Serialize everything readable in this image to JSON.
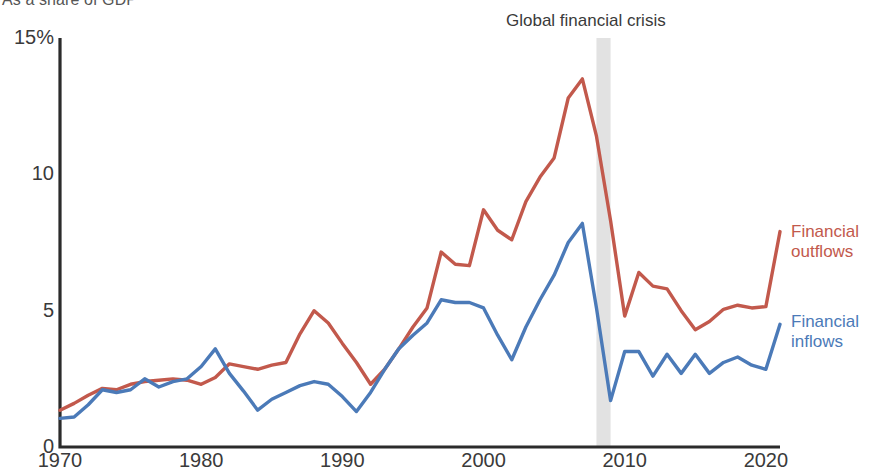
{
  "subtitle": "As a share of GDP",
  "annotations": {
    "crisis_label": "Global financial crisis",
    "crisis_band_start": 2008,
    "crisis_band_end": 2009
  },
  "axes": {
    "y_ticks": [
      "15%",
      "10",
      "5",
      "0"
    ],
    "y_tick_values": [
      15,
      10,
      5,
      0
    ],
    "x_ticks": [
      "1970",
      "1980",
      "1990",
      "2000",
      "2010",
      "2020"
    ],
    "x_tick_values": [
      1970,
      1980,
      1990,
      2000,
      2010,
      2020
    ]
  },
  "legend": {
    "outflows_line1": "Financial",
    "outflows_line2": "outflows",
    "inflows_line1": "Financial",
    "inflows_line2": "inflows"
  },
  "colors": {
    "outflows": "#c2594c",
    "inflows": "#4b7ab8",
    "axis": "#2b2b2b",
    "crisis_band": "#e2e2e2",
    "text": "#3a3a3a"
  },
  "chart_data": {
    "type": "line",
    "title": "",
    "subtitle": "As a share of GDP",
    "xlabel": "",
    "ylabel": "",
    "xlim": [
      1970,
      2021
    ],
    "ylim": [
      0,
      15
    ],
    "grid": false,
    "legend_position": "right",
    "x": [
      1970,
      1971,
      1972,
      1973,
      1974,
      1975,
      1976,
      1977,
      1978,
      1979,
      1980,
      1981,
      1982,
      1983,
      1984,
      1985,
      1986,
      1987,
      1988,
      1989,
      1990,
      1991,
      1992,
      1993,
      1994,
      1995,
      1996,
      1997,
      1998,
      1999,
      2000,
      2001,
      2002,
      2003,
      2004,
      2005,
      2006,
      2007,
      2008,
      2009,
      2010,
      2011,
      2012,
      2013,
      2014,
      2015,
      2016,
      2017,
      2018,
      2019,
      2020,
      2021
    ],
    "series": [
      {
        "name": "Financial outflows",
        "color": "#c2594c",
        "values": [
          1.35,
          1.6,
          1.9,
          2.15,
          2.1,
          2.3,
          2.4,
          2.45,
          2.5,
          2.45,
          2.3,
          2.55,
          3.05,
          2.95,
          2.85,
          3.0,
          3.1,
          4.15,
          5.0,
          4.55,
          3.8,
          3.1,
          2.3,
          2.85,
          3.6,
          4.4,
          5.1,
          7.15,
          6.7,
          6.65,
          8.7,
          7.95,
          7.6,
          9.0,
          9.9,
          10.6,
          12.8,
          13.5,
          11.4,
          8.3,
          4.8,
          6.4,
          5.9,
          5.8,
          5.0,
          4.3,
          4.6,
          5.05,
          5.2,
          5.1,
          5.15,
          7.9
        ]
      },
      {
        "name": "Financial inflows",
        "color": "#4b7ab8",
        "values": [
          1.05,
          1.1,
          1.55,
          2.1,
          2.0,
          2.1,
          2.5,
          2.2,
          2.4,
          2.5,
          2.95,
          3.6,
          2.7,
          2.05,
          1.35,
          1.75,
          2.0,
          2.25,
          2.4,
          2.3,
          1.85,
          1.3,
          2.0,
          2.85,
          3.6,
          4.1,
          4.55,
          5.4,
          5.3,
          5.3,
          5.1,
          4.1,
          3.2,
          4.4,
          5.4,
          6.3,
          7.5,
          8.2,
          5.1,
          1.7,
          3.5,
          3.5,
          2.6,
          3.4,
          2.7,
          3.4,
          2.7,
          3.1,
          3.3,
          3.0,
          2.85,
          4.5
        ]
      }
    ]
  }
}
